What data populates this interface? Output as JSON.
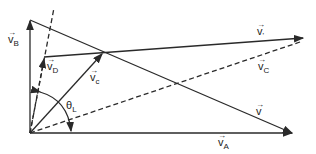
{
  "diagram": {
    "labels": {
      "vB": {
        "base": "v",
        "sub": "B"
      },
      "vD": {
        "base": "v",
        "sub": "D"
      },
      "vc": {
        "base": "v",
        "sub": "c"
      },
      "vprime": {
        "base": "v",
        "sub": "'"
      },
      "vC": {
        "base": "v",
        "sub": "C"
      },
      "v": {
        "base": "v",
        "sub": ""
      },
      "vA": {
        "base": "v",
        "sub": "A"
      },
      "theta": {
        "base": "θ",
        "sub": "L"
      }
    },
    "arrow_glyph": "→",
    "colors": {
      "line": "#2a2a2a",
      "background": "#ffffff"
    }
  }
}
